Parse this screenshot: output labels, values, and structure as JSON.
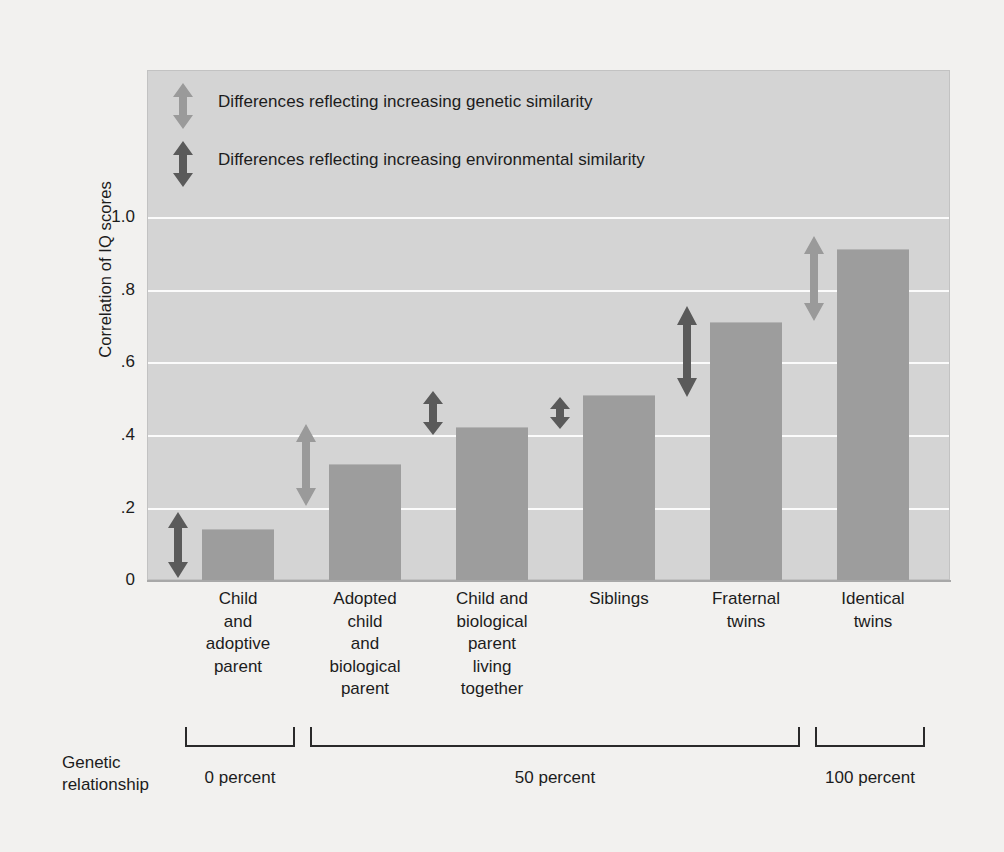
{
  "chart_data": {
    "type": "bar",
    "title": "",
    "xlabel": "",
    "ylabel": "Correlation of IQ scores",
    "ylim": [
      0,
      1.1
    ],
    "grid": true,
    "categories": [
      "Child\nand\nadoptive\nparent",
      "Adopted\nchild\nand\nbiological\nparent",
      "Child and\nbiological\nparent\nliving\ntogether",
      "Siblings",
      "Fraternal\ntwins",
      "Identical\ntwins"
    ],
    "values": [
      0.14,
      0.32,
      0.42,
      0.51,
      0.71,
      0.91
    ],
    "ytick_labels": [
      "1.0",
      ".8",
      ".6",
      ".4",
      ".2",
      "0"
    ],
    "ytick_values": [
      1.0,
      0.8,
      0.6,
      0.4,
      0.2,
      0
    ],
    "bar_color": "#9d9d9d",
    "panel_color": "#d4d4d4",
    "gridline_color": "#fbfbfb",
    "legend_position": "top-left",
    "annotations": {
      "genetic_arrow_color": "#9a9a9a",
      "environmental_arrow_color": "#5a5a5a",
      "genetic_arrows": [
        {
          "category": "Adopted child and biological parent",
          "from": 0.16,
          "to": 0.39
        },
        {
          "category": "Fraternal twins",
          "from": 0.735,
          "to": 0.93
        }
      ],
      "environmental_arrows": [
        {
          "category": "Child and adoptive parent",
          "from": 0.02,
          "to": 0.175
        },
        {
          "category": "Child and biological parent living together",
          "from": 0.345,
          "to": 0.45
        },
        {
          "category": "Siblings",
          "from": 0.44,
          "to": 0.5
        },
        {
          "category": "Fraternal twins",
          "from": 0.535,
          "to": 0.745
        }
      ]
    }
  },
  "legend": {
    "items": [
      {
        "icon": "double-arrow-light",
        "label": "Differences reflecting increasing genetic similarity",
        "color": "#9a9a9a"
      },
      {
        "icon": "double-arrow-dark",
        "label": "Differences reflecting increasing environmental similarity",
        "color": "#5a5a5a"
      }
    ]
  },
  "axis": {
    "y_title": "Correlation of IQ scores",
    "y_ticks": [
      "1.0",
      ".8",
      ".6",
      ".4",
      ".2",
      "0"
    ]
  },
  "categories": {
    "c0": "Child\nand\nadoptive\nparent",
    "c1": "Adopted\nchild\nand\nbiological\nparent",
    "c2": "Child and\nbiological\nparent\nliving\ntogether",
    "c3": "Siblings",
    "c4": "Fraternal\ntwins",
    "c5": "Identical\ntwins"
  },
  "footer": {
    "genetic_relationship_label": "Genetic\nrelationship",
    "groups": [
      {
        "label": "0 percent",
        "members": [
          "Child and adoptive parent"
        ]
      },
      {
        "label": "50 percent",
        "members": [
          "Adopted child and biological parent",
          "Child and biological parent living together",
          "Siblings",
          "Fraternal twins"
        ]
      },
      {
        "label": "100 percent",
        "members": [
          "Identical twins"
        ]
      }
    ]
  }
}
